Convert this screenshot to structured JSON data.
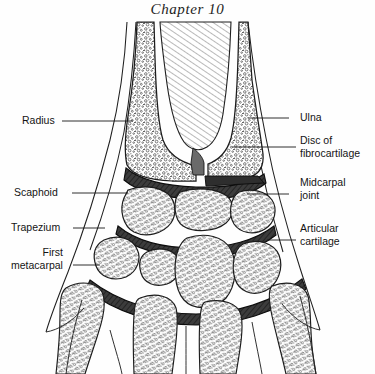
{
  "page": {
    "chapter_title": "Chapter 10",
    "background_color": "#fefefe",
    "ink_color": "#1a1a1a",
    "width": 375,
    "height": 374
  },
  "figure": {
    "name": "coronal-section-of-wrist-joint",
    "texture_ink": "#2a2a2a",
    "cartilage_fill": "#3a3a3a"
  },
  "labels": {
    "left": [
      {
        "id": "radius",
        "lines": [
          "Radius"
        ],
        "text_x": 22,
        "text_y": 114,
        "leader_x1": 62,
        "leader_y1": 121,
        "leader_x2": 133,
        "leader_y2": 121
      },
      {
        "id": "scaphoid",
        "lines": [
          "Scaphoid"
        ],
        "text_x": 14,
        "text_y": 186,
        "leader_x1": 72,
        "leader_y1": 193,
        "leader_x2": 128,
        "leader_y2": 193
      },
      {
        "id": "trapezium",
        "lines": [
          "Trapezium"
        ],
        "text_x": 11,
        "text_y": 221,
        "leader_x1": 73,
        "leader_y1": 228,
        "leader_x2": 105,
        "leader_y2": 228
      },
      {
        "id": "first-metacarpal",
        "lines": [
          "First",
          "metacarpal"
        ],
        "text_x": 11,
        "text_y": 246,
        "leader_x1": 73,
        "leader_y1": 265,
        "leader_x2": 100,
        "leader_y2": 265
      }
    ],
    "right": [
      {
        "id": "ulna",
        "lines": [
          "Ulna"
        ],
        "text_x": 300,
        "text_y": 111,
        "leader_x1": 289,
        "leader_y1": 118,
        "leader_x2": 248,
        "leader_y2": 118
      },
      {
        "id": "disc-of-fibrocartilage",
        "lines": [
          "Disc of",
          "fibrocartilage"
        ],
        "text_x": 300,
        "text_y": 134,
        "leader_x1": 296,
        "leader_y1": 147,
        "leader_x2": 232,
        "leader_y2": 147
      },
      {
        "id": "midcarpal-joint",
        "lines": [
          "Midcarpal",
          "joint"
        ],
        "text_x": 300,
        "text_y": 176,
        "leader_x1": 289,
        "leader_y1": 194,
        "leader_x2": 247,
        "leader_y2": 194
      },
      {
        "id": "articular-cartilage",
        "lines": [
          "Articular",
          "cartilage"
        ],
        "text_x": 300,
        "text_y": 222,
        "leader_x1": 296,
        "leader_y1": 240,
        "leader_x2": 267,
        "leader_y2": 240
      }
    ]
  }
}
